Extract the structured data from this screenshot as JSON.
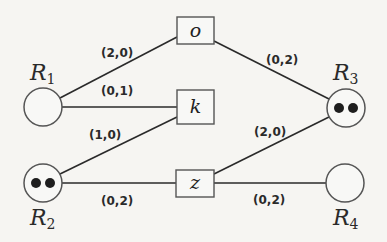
{
  "diagram": {
    "type": "bipartite-resource-task-graph",
    "resources": [
      {
        "id": "R1",
        "label": "R",
        "sub": "1",
        "tokens": 0
      },
      {
        "id": "R2",
        "label": "R",
        "sub": "2",
        "tokens": 2
      },
      {
        "id": "R3",
        "label": "R",
        "sub": "3",
        "tokens": 2
      },
      {
        "id": "R4",
        "label": "R",
        "sub": "4",
        "tokens": 0
      }
    ],
    "tasks": [
      {
        "id": "o",
        "label": "o"
      },
      {
        "id": "k",
        "label": "k"
      },
      {
        "id": "z",
        "label": "z"
      }
    ],
    "edges": [
      {
        "from": "R1",
        "to": "o",
        "label": "(2,0)"
      },
      {
        "from": "R1",
        "to": "k",
        "label": "(0,1)"
      },
      {
        "from": "R2",
        "to": "k",
        "label": "(1,0)"
      },
      {
        "from": "R2",
        "to": "z",
        "label": "(0,2)"
      },
      {
        "from": "o",
        "to": "R3",
        "label": "(0,2)"
      },
      {
        "from": "z",
        "to": "R3",
        "label": "(2,0)"
      },
      {
        "from": "z",
        "to": "R4",
        "label": "(0,2)"
      }
    ]
  }
}
